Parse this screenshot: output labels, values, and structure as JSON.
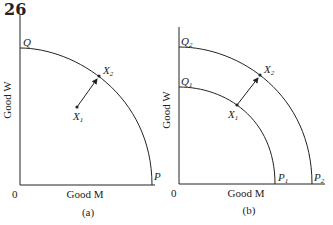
{
  "page_number": "26",
  "panels": [
    {
      "caption": "(a)",
      "y_axis_label": "Good W",
      "x_axis_label": "Good M",
      "origin_label": "0",
      "curves": [
        {
          "top_label": "Q",
          "bottom_label": "P"
        }
      ],
      "points": [
        {
          "label": "X",
          "sub": "1"
        },
        {
          "label": "X",
          "sub": "2"
        }
      ]
    },
    {
      "caption": "(b)",
      "y_axis_label": "Good W",
      "x_axis_label": "Good M",
      "origin_label": "0",
      "curves": [
        {
          "top_label": "Q",
          "top_sub": "1",
          "bottom_label": "P",
          "bottom_sub": "1"
        },
        {
          "top_label": "Q",
          "top_sub": "2",
          "bottom_label": "P",
          "bottom_sub": "2"
        }
      ],
      "points": [
        {
          "label": "X",
          "sub": "1"
        },
        {
          "label": "X",
          "sub": "2"
        }
      ]
    }
  ]
}
